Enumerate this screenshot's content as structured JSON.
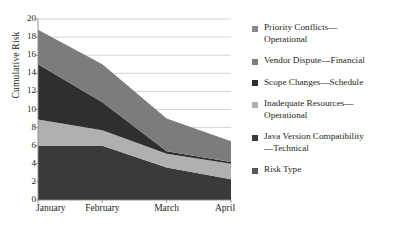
{
  "chart_data": {
    "type": "area",
    "title": "",
    "subtitle": "",
    "xlabel": "",
    "ylabel": "Cumulative Risk",
    "categories": [
      "January",
      "February",
      "March",
      "April"
    ],
    "x_tick_labels": [
      "January",
      "February",
      "March",
      "April"
    ],
    "y_tick_labels": [
      "0",
      "2",
      "4",
      "6",
      "8",
      "10",
      "12",
      "14",
      "16",
      "18",
      "20"
    ],
    "y_ticks": [
      0,
      2,
      4,
      6,
      8,
      10,
      12,
      14,
      16,
      18,
      20
    ],
    "ylim": [
      0,
      20
    ],
    "grid": "horizontal",
    "stacked": true,
    "legend_position": "right",
    "series": [
      {
        "name": "Java Version Compatibility—Technical",
        "color": "#3a3a3c",
        "values": [
          6.0,
          6.0,
          3.6,
          2.3
        ]
      },
      {
        "name": "Inadequate Resources—Operational",
        "color": "#b0b0b0",
        "values": [
          2.9,
          1.7,
          1.5,
          1.7
        ]
      },
      {
        "name": "Scope Changes—Schedule",
        "color": "#2f2f31",
        "values": [
          6.1,
          3.1,
          0.3,
          0.2
        ]
      },
      {
        "name": "Vendor Dispute—Financial",
        "color": "#7c7c7e",
        "values": [
          3.8,
          4.2,
          3.6,
          2.3
        ]
      }
    ],
    "totals": [
      18.8,
      15.0,
      9.0,
      6.5
    ],
    "annotations": []
  },
  "legend": {
    "items": [
      {
        "label": "Priority Conflicts—\nOperational",
        "color": "#8a8a8c",
        "swatch_name": "legend-swatch-priority-conflicts"
      },
      {
        "label": "Vendor Dispute—Financial",
        "color": "#7c7c7e",
        "swatch_name": "legend-swatch-vendor-dispute"
      },
      {
        "label": "Scope Changes—Schedule",
        "color": "#2f2f31",
        "swatch_name": "legend-swatch-scope-changes"
      },
      {
        "label": "Inadequate Resources—\nOperational",
        "color": "#b0b0b0",
        "swatch_name": "legend-swatch-inadequate-resources"
      },
      {
        "label": "Java Version Compatibility\n—Technical",
        "color": "#3a3a3c",
        "swatch_name": "legend-swatch-java-version"
      },
      {
        "label": "Risk Type",
        "color": "#58585a",
        "swatch_name": "legend-swatch-risk-type"
      }
    ]
  },
  "axes": {
    "y_title": "Cumulative Risk",
    "y_labels": [
      "20",
      "18",
      "16",
      "14",
      "12",
      "10",
      "8",
      "6",
      "4",
      "2",
      "0"
    ],
    "x_labels": [
      "January",
      "February",
      "March",
      "April"
    ]
  },
  "colors": {
    "grid": "#c9c9c9",
    "axis": "#8d8d8d",
    "text": "#231f20",
    "background": "#ffffff"
  }
}
